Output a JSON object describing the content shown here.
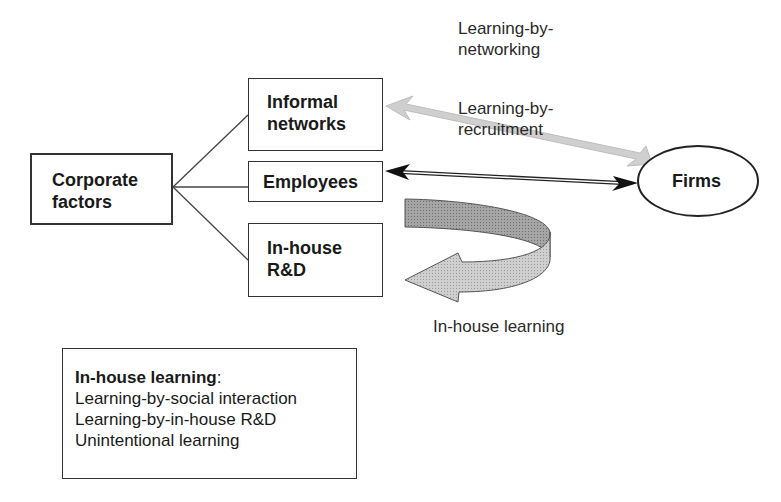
{
  "nodes": {
    "corporate": {
      "line1": "Corporate",
      "line2": "factors"
    },
    "informal": {
      "line1": "Informal",
      "line2": "networks"
    },
    "employees": {
      "label": "Employees"
    },
    "inhouse_rd": {
      "line1": "In-house",
      "line2": "R&D"
    },
    "firms": {
      "label": "Firms"
    }
  },
  "edge_labels": {
    "networking": {
      "line1": "Learning-by-",
      "line2": "networking"
    },
    "recruitment": {
      "line1": "Learning-by-",
      "line2": "recruitment"
    },
    "inhouse": "In-house learning"
  },
  "legend": {
    "title": "In-house learning",
    "title_suffix": ":",
    "items": [
      "Learning-by-social interaction",
      "Learning-by-in-house R&D",
      "Unintentional learning"
    ]
  },
  "colors": {
    "stroke": "#333333",
    "gray_arrow": "#c8c8c8",
    "curve_dark": "#a8a8a8",
    "curve_light": "#d4d4d4"
  }
}
